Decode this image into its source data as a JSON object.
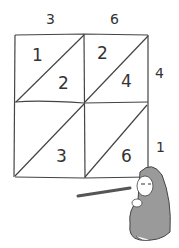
{
  "diagram": {
    "type": "lattice-multiplication",
    "multiplicand_digits": [
      "3",
      "6"
    ],
    "multiplier_digits": [
      "4",
      "1"
    ],
    "cells": [
      {
        "row": 0,
        "col": 0,
        "tens": "1",
        "ones": "2"
      },
      {
        "row": 0,
        "col": 1,
        "tens": "2",
        "ones": "4"
      },
      {
        "row": 1,
        "col": 0,
        "tens": "",
        "ones": "3"
      },
      {
        "row": 1,
        "col": 1,
        "tens": "",
        "ones": "6"
      }
    ],
    "illustration": "seated figure in hooded cloak pointing with a stick at the grid",
    "colors": {
      "line": "#444444",
      "cloak": "#9a9a9a",
      "background": "#ffffff"
    }
  }
}
